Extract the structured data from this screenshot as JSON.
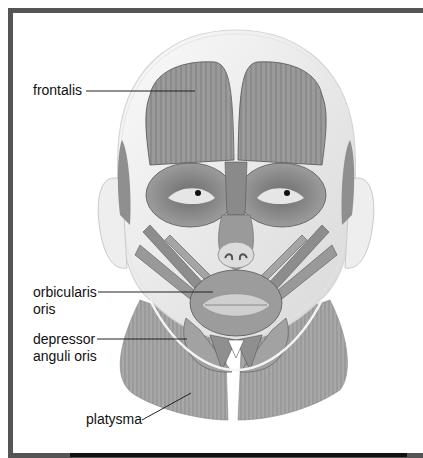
{
  "figure": {
    "labels": [
      {
        "id": "frontalis",
        "lines": [
          "frontalis"
        ]
      },
      {
        "id": "orbicularis-oris",
        "lines": [
          "orbicularis",
          "oris"
        ]
      },
      {
        "id": "depressor-anguli-oris",
        "lines": [
          "depressor",
          "anguli oris"
        ]
      },
      {
        "id": "platysma",
        "lines": [
          "platysma"
        ]
      }
    ]
  },
  "colors": {
    "frame": "#555555",
    "muscle": "#8a8a8a",
    "muscle_light": "#b5b5b5",
    "outline": "#cfcfcf",
    "text": "#111111"
  }
}
